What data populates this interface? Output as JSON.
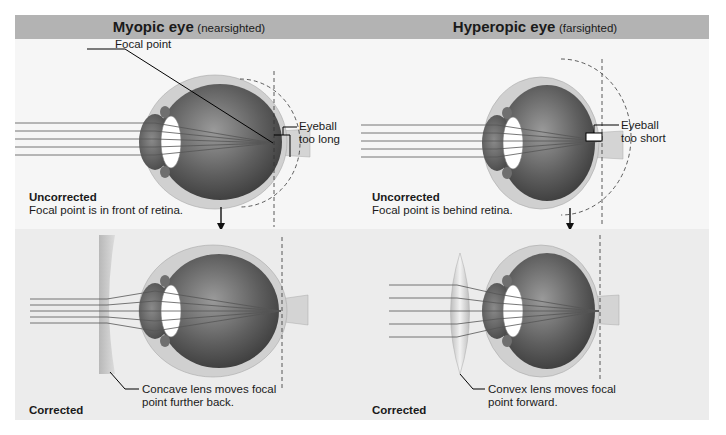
{
  "panels": [
    {
      "title": "Myopic eye",
      "subtitle": "(nearsighted)",
      "uncorrected": {
        "heading": "Uncorrected",
        "description": "Focal point is in front of retina.",
        "labels": {
          "focal_point": "Focal point",
          "eyeball_line1": "Eyeball",
          "eyeball_line2": "too long"
        }
      },
      "corrected": {
        "heading": "Corrected",
        "lens_type": "concave",
        "label_line1": "Concave lens moves focal",
        "label_line2": "point further back."
      }
    },
    {
      "title": "Hyperopic eye",
      "subtitle": "(farsighted)",
      "uncorrected": {
        "heading": "Uncorrected",
        "description": "Focal point is behind retina.",
        "labels": {
          "eyeball_line1": "Eyeball",
          "eyeball_line2": "too short"
        }
      },
      "corrected": {
        "heading": "Corrected",
        "lens_type": "convex",
        "label_line1": "Convex lens moves focal",
        "label_line2": "point forward."
      }
    }
  ],
  "colors": {
    "header_bg": "#b3b3b3",
    "top_bg": "#f6f6f6",
    "bottom_bg": "#ececec",
    "eye_outer": "#cfcfcf",
    "eye_inner": "#5a5a5a",
    "lens_fill": "#d9d9d9"
  }
}
